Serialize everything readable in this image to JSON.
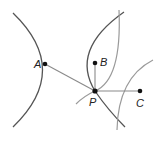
{
  "diagram": {
    "points": {
      "A": {
        "label": "A",
        "x": 45,
        "y": 64
      },
      "B": {
        "label": "B",
        "x": 95,
        "y": 63
      },
      "C": {
        "label": "C",
        "x": 140,
        "y": 91
      },
      "P": {
        "label": "P",
        "x": 95,
        "y": 91
      }
    },
    "colors": {
      "dark_curve": "#555555",
      "gray_curve": "#9a9a9a",
      "segment": "#8a8a8a",
      "point": "#111111"
    }
  }
}
